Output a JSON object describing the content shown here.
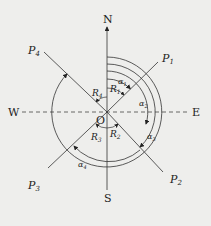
{
  "diagram": {
    "origin_label": "O",
    "directions": {
      "north": "N",
      "south": "S",
      "east": "E",
      "west": "W"
    },
    "points": [
      {
        "label": "P",
        "sub": "1"
      },
      {
        "label": "P",
        "sub": "2"
      },
      {
        "label": "P",
        "sub": "3"
      },
      {
        "label": "P",
        "sub": "4"
      }
    ],
    "bearings": [
      {
        "label": "R",
        "sub": "1"
      },
      {
        "label": "R",
        "sub": "2"
      },
      {
        "label": "R",
        "sub": "3"
      },
      {
        "label": "R",
        "sub": "4"
      }
    ],
    "azimuths": [
      {
        "label": "α",
        "sub": "1"
      },
      {
        "label": "α",
        "sub": "2"
      },
      {
        "label": "α",
        "sub": "3"
      },
      {
        "label": "α",
        "sub": "4"
      }
    ],
    "colors": {
      "background": "#eeeeec",
      "line": "#333333"
    }
  }
}
